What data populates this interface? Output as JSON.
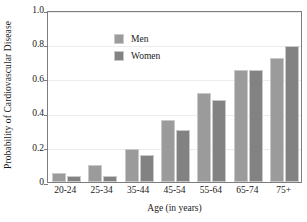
{
  "chart_data": {
    "type": "bar",
    "title": "",
    "xlabel": "Age (in years)",
    "ylabel": "Probability of Cardiovascular Disease",
    "categories": [
      "20-24",
      "25-34",
      "35-44",
      "45-54",
      "55-64",
      "65-74",
      "75+"
    ],
    "series": [
      {
        "name": "Men",
        "color": "#9b9b9b",
        "values": [
          0.05,
          0.1,
          0.19,
          0.36,
          0.52,
          0.65,
          0.72
        ]
      },
      {
        "name": "Women",
        "color": "#828282",
        "values": [
          0.035,
          0.035,
          0.155,
          0.3,
          0.475,
          0.65,
          0.79
        ]
      }
    ],
    "ylim": [
      0,
      1.0
    ],
    "yticks": [
      0,
      0.2,
      0.4,
      0.6,
      0.8,
      1.0
    ],
    "ytick_labels": [
      "0",
      "0.2",
      "0.4",
      "0.6",
      "0.8",
      "1.0"
    ],
    "grid": true,
    "legend_position": "upper-left",
    "legend": [
      "Men",
      "Women"
    ]
  }
}
